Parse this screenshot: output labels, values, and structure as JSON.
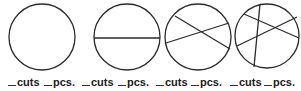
{
  "colors": {
    "stroke": "#2a2a2a",
    "text": "#1a1a1a",
    "background": "#ffffff"
  },
  "circles": [
    {
      "id": 1,
      "center": [
        42,
        37
      ],
      "radius": 33,
      "cut_lines": []
    },
    {
      "id": 2,
      "center": [
        127,
        37
      ],
      "radius": 33,
      "cut_lines": [
        [
          94,
          38,
          160,
          38
        ]
      ]
    },
    {
      "id": 3,
      "center": [
        198,
        37
      ],
      "radius": 33,
      "cut_lines": [
        [
          175,
          16,
          230,
          49
        ],
        [
          166,
          43,
          229,
          23
        ]
      ]
    },
    {
      "id": 4,
      "center": [
        267,
        36
      ],
      "radius": 33,
      "cut_lines": [
        [
          260,
          5,
          254,
          65
        ],
        [
          244,
          14,
          300,
          38
        ],
        [
          237,
          46,
          298,
          17
        ]
      ]
    }
  ],
  "labels": [
    {
      "cuts_label": "cuts",
      "pcs_label": "pcs."
    },
    {
      "cuts_label": "cuts",
      "pcs_label": "pcs."
    },
    {
      "cuts_label": "cuts",
      "pcs_label": "pcs."
    },
    {
      "cuts_label": "cuts",
      "pcs_label": "pcs."
    }
  ]
}
